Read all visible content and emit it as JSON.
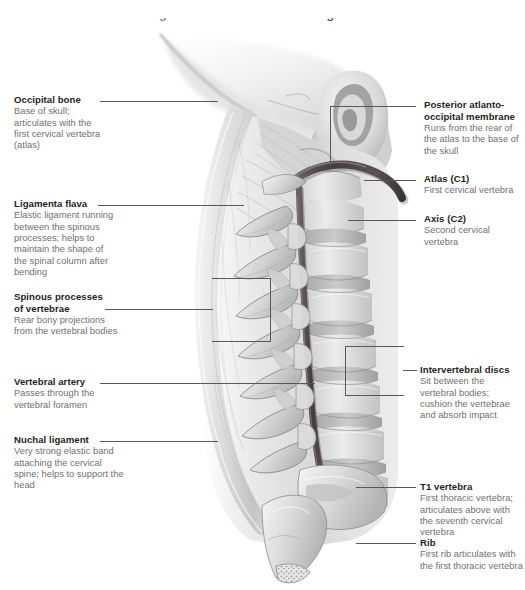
{
  "figure": {
    "title": "Right lateral view of cervical ligaments",
    "illustration_name": "cervical-spine-right-lateral-illustration",
    "style": {
      "palette": "grayscale",
      "background": "#ffffff",
      "heading_color": "#231f20",
      "body_color": "#6f6f6f",
      "leader_color": "#58585a",
      "bone_light": "#e8e8e8",
      "bone_mid": "#c9c9c9",
      "bone_shadow": "#9a9a9a",
      "artery_dark": "#4a4446"
    }
  },
  "labels_left": [
    {
      "id": "occipital-bone",
      "heading": "Occipital bone",
      "body": "Base of skull; articulates with the first cervical vertebra (atlas)"
    },
    {
      "id": "ligamenta-flava",
      "heading": "Ligamenta flava",
      "body": "Elastic ligament running between the spinous processes; helps to maintain the shape of the spinal column after bending"
    },
    {
      "id": "spinous-processes-of-vertebrae",
      "heading": "Spinous processes of vertebrae",
      "heading_line_1": "Spinous processes",
      "heading_line_2": "of vertebrae",
      "body": "Rear bony projections from the vertebral bodies"
    },
    {
      "id": "vertebral-artery",
      "heading": "Vertebral artery",
      "body": "Passes through the vertebral foramen"
    },
    {
      "id": "nuchal-ligament",
      "heading": "Nuchal ligament",
      "body": "Very strong elastic band attaching the cervical spine; helps to support the head"
    }
  ],
  "labels_right": [
    {
      "id": "posterior-atlanto-occipital-membrane",
      "heading": "Posterior atlanto-occipital membrane",
      "heading_line_1": "Posterior atlanto-",
      "heading_line_2": "occipital membrane",
      "body": "Runs from the rear of the atlas to the base of the skull"
    },
    {
      "id": "atlas-c1",
      "heading": "Atlas (C1)",
      "body": "First cervical vertebra"
    },
    {
      "id": "axis-c2",
      "heading": "Axis (C2)",
      "body": "Second cervical vertebra"
    },
    {
      "id": "intervertebral-discs",
      "heading": "Intervertebral discs",
      "body": "Sit between the vertebral bodies; cushion the vertebrae and absorb impact"
    },
    {
      "id": "t1-vertebra",
      "heading": "T1 vertebra",
      "body": "First thoracic vertebra; articulates above with the seventh cervical vertebra"
    },
    {
      "id": "rib",
      "heading": "Rib",
      "body": "First rib articulates with the first thoracic vertebra"
    }
  ]
}
